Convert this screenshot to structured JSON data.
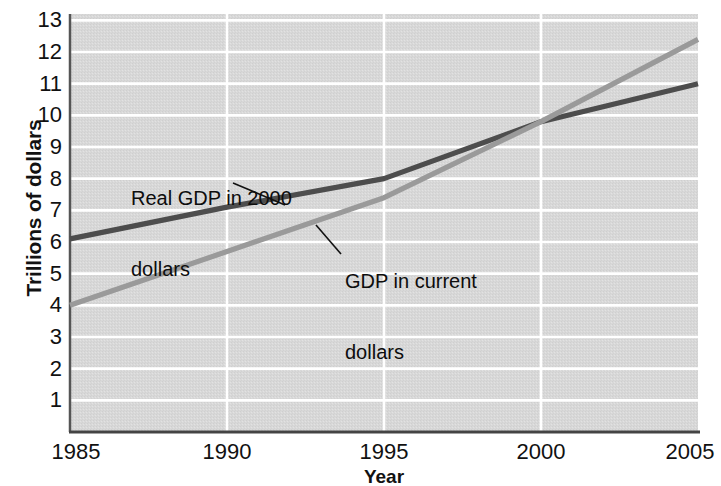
{
  "chart_data": {
    "type": "line",
    "title": "",
    "xlabel": "Year",
    "ylabel": "Trillions of dollars",
    "xlim": [
      1985,
      2005
    ],
    "ylim": [
      0,
      13.2
    ],
    "xticks": [
      1985,
      1990,
      1995,
      2000,
      2005
    ],
    "yticks": [
      1,
      2,
      3,
      4,
      5,
      6,
      7,
      8,
      9,
      10,
      11,
      12,
      13
    ],
    "grid": true,
    "grid_color": "#ffffff",
    "plot_background": "#d8d8d8",
    "legend_position": "inline-annotations",
    "x": [
      1985,
      1990,
      1995,
      2000,
      2005
    ],
    "series": [
      {
        "name": "Real GDP in 2000 dollars",
        "color": "#4d4d4d",
        "values": [
          6.1,
          7.1,
          8.0,
          9.8,
          11.0
        ]
      },
      {
        "name": "GDP in current dollars",
        "color": "#9a9a9a",
        "values": [
          4.0,
          5.7,
          7.4,
          9.8,
          12.4
        ]
      }
    ],
    "annotations": [
      {
        "id": "real-gdp",
        "line1": "Real GDP in 2000",
        "line2": "dollars",
        "leader_from": [
          233,
          183
        ],
        "leader_to": [
          285,
          205
        ]
      },
      {
        "id": "current-gdp",
        "line1": "GDP in current",
        "line2": "dollars",
        "leader_from": [
          341,
          254
        ],
        "leader_to": [
          316,
          225
        ]
      }
    ]
  },
  "axes": {
    "y_title": "Trillions of dollars",
    "x_title": "Year",
    "y_tick_labels": [
      "13",
      "12",
      "11",
      "10",
      "9",
      "8",
      "7",
      "6",
      "5",
      "4",
      "3",
      "2",
      "1"
    ],
    "x_tick_labels": [
      "1985",
      "1990",
      "1995",
      "2000",
      "2005"
    ]
  },
  "annotations": {
    "real_gdp_l1": "Real GDP in 2000",
    "real_gdp_l2": "dollars",
    "current_gdp_l1": "GDP in current",
    "current_gdp_l2": "dollars"
  },
  "colors": {
    "plot_bg": "#d8d8d8",
    "grid": "#ffffff",
    "axis": "#4a4a4a",
    "series_real": "#4d4d4d",
    "series_current": "#9a9a9a",
    "text": "#111111"
  }
}
